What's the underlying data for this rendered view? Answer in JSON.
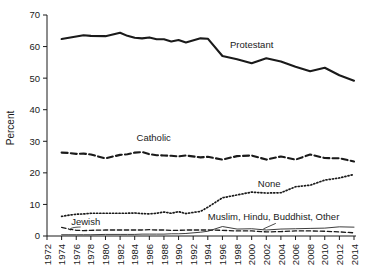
{
  "chart_data": {
    "type": "line",
    "title": "",
    "xlabel": "",
    "ylabel": "Percent",
    "xlim": [
      1972,
      2014
    ],
    "ylim": [
      0,
      70
    ],
    "grid": false,
    "legend_position": "inline-labels",
    "x_ticks": [
      "1972",
      "1974",
      "1976",
      "1978",
      "1980",
      "1982",
      "1984",
      "1986",
      "1988",
      "1990",
      "1992",
      "1994",
      "1996",
      "1998",
      "2000",
      "2002",
      "2004",
      "2006",
      "2008",
      "2010",
      "2012",
      "2014"
    ],
    "y_ticks": [
      "0",
      "10",
      "20",
      "30",
      "40",
      "50",
      "60",
      "70"
    ],
    "x": [
      1974,
      1975,
      1976,
      1977,
      1978,
      1980,
      1982,
      1983,
      1984,
      1985,
      1986,
      1987,
      1988,
      1989,
      1990,
      1991,
      1993,
      1994,
      1996,
      1998,
      2000,
      2002,
      2004,
      2006,
      2008,
      2010,
      2012,
      2014
    ],
    "series": [
      {
        "name": "Protestant",
        "style": "thick-solid",
        "label": "Protestant",
        "label_x": 2000.0,
        "label_y": 59.6,
        "values": [
          62.4,
          62.8,
          63.2,
          63.6,
          63.4,
          63.3,
          64.4,
          63.4,
          62.8,
          62.6,
          62.9,
          62.3,
          62.3,
          61.6,
          62.1,
          61.3,
          62.6,
          62.5,
          57.0,
          56.0,
          54.7,
          56.3,
          55.3,
          53.6,
          52.2,
          53.3,
          50.9,
          49.2
        ]
      },
      {
        "name": "Catholic",
        "style": "thick-dashed",
        "label": "Catholic",
        "label_x": 1986.6,
        "label_y": 30.1,
        "values": [
          26.4,
          26.3,
          26.0,
          26.1,
          25.8,
          24.6,
          25.7,
          25.9,
          26.4,
          26.6,
          25.9,
          25.6,
          25.5,
          25.4,
          25.2,
          25.5,
          24.9,
          25.1,
          24.2,
          25.3,
          25.5,
          24.2,
          25.2,
          24.2,
          25.8,
          24.7,
          24.6,
          23.6
        ]
      },
      {
        "name": "None",
        "style": "dotted",
        "label": "None",
        "label_x": 2002.4,
        "label_y": 15.5,
        "values": [
          6.2,
          6.6,
          6.9,
          7.0,
          7.2,
          7.2,
          7.2,
          7.2,
          7.3,
          7.1,
          7.0,
          7.2,
          7.6,
          7.2,
          7.7,
          7.1,
          7.8,
          9.1,
          12.1,
          13.0,
          13.9,
          13.6,
          13.7,
          15.6,
          16.1,
          17.7,
          18.4,
          19.5
        ]
      },
      {
        "name": "Jewish",
        "style": "thin-dashed",
        "label": "Jewish",
        "label_x": 1977.3,
        "label_y": 3.4,
        "values": [
          2.7,
          2.2,
          1.8,
          1.7,
          1.8,
          1.9,
          1.9,
          1.9,
          1.9,
          1.9,
          2.0,
          1.9,
          1.9,
          1.8,
          1.8,
          1.9,
          1.9,
          1.9,
          1.8,
          1.6,
          1.6,
          1.3,
          1.4,
          1.6,
          1.6,
          1.5,
          1.3,
          1.0
        ]
      },
      {
        "name": "Muslim, Hindu, Buddhist, Other",
        "style": "thin-solid",
        "label": "Muslim, Hindu, Buddhist, Other",
        "label_x": 2003.0,
        "label_y": 5.0,
        "values": [
          0.4,
          0.4,
          0.4,
          0.4,
          0.4,
          0.5,
          0.5,
          0.5,
          0.5,
          0.6,
          0.6,
          0.6,
          0.6,
          0.7,
          0.7,
          0.8,
          1.2,
          1.5,
          3.0,
          2.2,
          2.3,
          1.9,
          2.2,
          2.3,
          2.4,
          2.5,
          2.9,
          2.8
        ]
      }
    ],
    "colors": {
      "line": "#1a1a1a",
      "axis": "#1a1a1a",
      "background": "#ffffff"
    }
  }
}
